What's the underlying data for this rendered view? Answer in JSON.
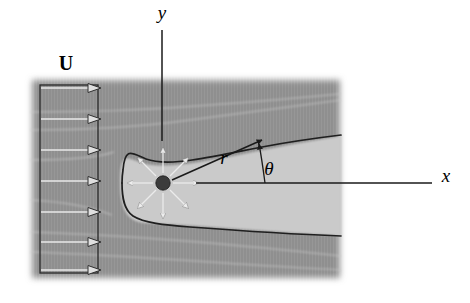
{
  "figure": {
    "width": 470,
    "height": 303
  },
  "colors": {
    "page_background": "#ffffff",
    "flow_field_dark_gray": "#8f8f8f",
    "flow_field_dark_gray_2": "#969696",
    "body_light_gray": "#c9c9c9",
    "body_light_gray_2": "#cfcfcf",
    "outline_black": "#1a1a1a",
    "arrow_white": "#e8e8e8",
    "streamline_light": "#b8b8b8",
    "source_dot": "#3a3a3a",
    "label_black": "#000000"
  },
  "labels": {
    "free_stream": {
      "text": "U",
      "style": "bold-upright-serif",
      "x": 66,
      "y": 70
    },
    "y_axis": {
      "text": "y",
      "style": "italic-serif",
      "x": 162,
      "y": 18
    },
    "x_axis": {
      "text": "x",
      "style": "italic-serif",
      "x": 446,
      "y": 180
    },
    "radius": {
      "text": "r",
      "style": "italic-serif",
      "x": 224,
      "y": 162
    },
    "angle": {
      "text": "θ",
      "style": "italic-serif-greek",
      "x": 267,
      "y": 172
    }
  },
  "geometry": {
    "velocity_profile_box": {
      "left": 40,
      "right": 98,
      "top": 85,
      "bottom": 273,
      "arrow_count": 7,
      "arrow_label": "uniform velocity arrows"
    },
    "source_point": {
      "x": 163,
      "y": 183,
      "radius": 7,
      "radiating_arrow_count": 8
    },
    "y_leader_line": {
      "x": 162,
      "y_top": 30,
      "y_bottom": 141
    },
    "x_leader_line": {
      "y": 183,
      "x_left": 196,
      "x_right": 432
    },
    "r_vector": {
      "from_x": 163,
      "from_y": 183,
      "to_x": 265,
      "to_y": 139
    },
    "theta_arc": {
      "center_x": 265,
      "center_y": 183,
      "from_angle_deg": 0,
      "to_angle_deg": 23
    },
    "body_nose_x": 122,
    "body_right_edge_x": 341,
    "flow_field_left_x": 30,
    "flow_field_right_x": 341,
    "flow_field_top_y": 78,
    "flow_field_bottom_y": 280
  },
  "elements": {
    "flow_field_name": "uniform-flow-field",
    "body_name": "rankine-half-body",
    "streamlines_name": "streamlines"
  }
}
